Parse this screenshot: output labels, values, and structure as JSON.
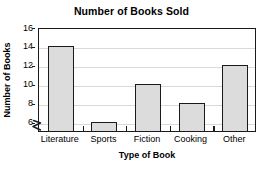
{
  "chart_data": {
    "type": "bar",
    "title": "Number of Books Sold",
    "xlabel": "Type of Book",
    "ylabel": "Number of Books",
    "categories": [
      "Literature",
      "Sports",
      "Fiction",
      "Cooking",
      "Other"
    ],
    "values": [
      14,
      6,
      10,
      8,
      12
    ],
    "ylim": [
      5,
      16
    ],
    "ytick_labels": [
      "16",
      "14",
      "12",
      "10",
      "8",
      "6"
    ],
    "ytick_values": [
      16,
      14,
      12,
      10,
      8,
      6
    ],
    "grid": true,
    "legend": "none",
    "axis_break": true,
    "axis_break_icon": "zigzag-axis-break-icon",
    "colors": {
      "bar_fill": "#dcdcdc",
      "bar_border": "#1a1a1a",
      "gridline": "#d9d9d9",
      "frame": "#1a1a1a",
      "text": "#000000",
      "background": "#ffffff"
    }
  }
}
